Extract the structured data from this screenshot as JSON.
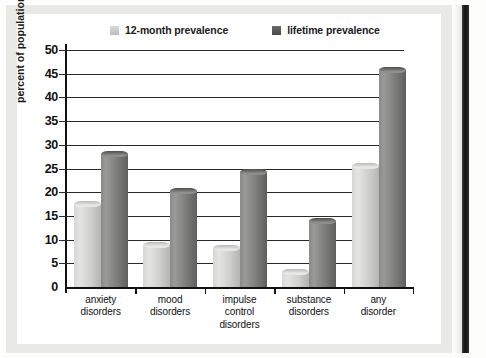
{
  "figure": {
    "legend": [
      {
        "label": "12-month prevalence",
        "color": "#c9c9c7",
        "icon": "legend-swatch-light"
      },
      {
        "label": "lifetime prevalence",
        "color": "#5d5d5b",
        "icon": "legend-swatch-dark"
      }
    ]
  },
  "chart_data": {
    "type": "bar",
    "title": "",
    "subtitle": "",
    "xlabel": "",
    "ylabel": "percent of population",
    "ylim": [
      0,
      50
    ],
    "yticks": [
      0,
      5,
      10,
      15,
      20,
      25,
      30,
      35,
      40,
      45,
      50
    ],
    "ytick_labels": [
      "0",
      "5",
      "10",
      "15",
      "20",
      "25",
      "30",
      "35",
      "40",
      "45",
      "50"
    ],
    "grid": true,
    "grid_axis": "y",
    "legend_position": "top",
    "categories": [
      "anxiety disorders",
      "mood disorders",
      "impulse control disorders",
      "substance disorders",
      "any disorder"
    ],
    "category_lines": [
      [
        "anxiety",
        "disorders"
      ],
      [
        "mood",
        "disorders"
      ],
      [
        "impulse",
        "control",
        "disorders"
      ],
      [
        "substance",
        "disorders"
      ],
      [
        "any",
        "disorder"
      ]
    ],
    "series": [
      {
        "name": "12-month prevalence",
        "color": "#d2d2d0",
        "values": [
          18.1,
          9.5,
          8.9,
          3.8,
          26.2
        ]
      },
      {
        "name": "lifetime prevalence",
        "color": "#6e6e6c",
        "values": [
          28.8,
          20.8,
          24.8,
          14.6,
          46.4
        ]
      }
    ]
  }
}
